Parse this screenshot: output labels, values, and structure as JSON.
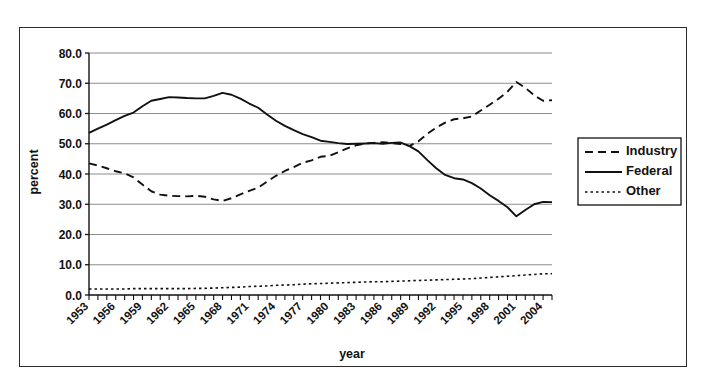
{
  "figure": {
    "background_color": "#ffffff",
    "frame_color": "#2b2b2b",
    "line_color": "#111111",
    "grid_color": "#8d8d8d"
  },
  "axis_titles": {
    "x": "year",
    "y": "percent"
  },
  "legend": {
    "position": "right",
    "entries": [
      {
        "label": "Industry",
        "style": "dashed"
      },
      {
        "label": "Federal",
        "style": "solid"
      },
      {
        "label": "Other",
        "style": "dotted"
      }
    ]
  },
  "y_ticks": [
    "0.0",
    "10.0",
    "20.0",
    "30.0",
    "40.0",
    "50.0",
    "60.0",
    "70.0",
    "80.0"
  ],
  "x_ticks": [
    "1953",
    "1956",
    "1959",
    "1962",
    "1965",
    "1968",
    "1971",
    "1974",
    "1977",
    "1980",
    "1983",
    "1986",
    "1989",
    "1992",
    "1995",
    "1998",
    "2001",
    "2004"
  ],
  "chart_data": {
    "type": "line",
    "title": "",
    "xlabel": "year",
    "ylabel": "percent",
    "xlim": [
      1953,
      2005
    ],
    "ylim": [
      0,
      80
    ],
    "grid": true,
    "legend_position": "right",
    "x": [
      1953,
      1954,
      1955,
      1956,
      1957,
      1958,
      1959,
      1960,
      1961,
      1962,
      1963,
      1964,
      1965,
      1966,
      1967,
      1968,
      1969,
      1970,
      1971,
      1972,
      1973,
      1974,
      1975,
      1976,
      1977,
      1978,
      1979,
      1980,
      1981,
      1982,
      1983,
      1984,
      1985,
      1986,
      1987,
      1988,
      1989,
      1990,
      1991,
      1992,
      1993,
      1994,
      1995,
      1996,
      1997,
      1998,
      1999,
      2000,
      2001,
      2002,
      2003,
      2004,
      2005
    ],
    "series": [
      {
        "name": "Industry",
        "style": "dashed",
        "values": [
          43.5,
          42.8,
          41.9,
          40.9,
          40.2,
          38.9,
          36.5,
          34.3,
          33.2,
          32.8,
          32.7,
          32.6,
          32.8,
          32.5,
          31.6,
          31.1,
          32.0,
          33.3,
          34.4,
          35.5,
          37.5,
          39.4,
          41.0,
          42.3,
          43.7,
          44.5,
          45.7,
          46.0,
          47.2,
          48.5,
          49.5,
          50.1,
          50.3,
          50.5,
          50.2,
          49.9,
          49.3,
          50.8,
          53.3,
          55.3,
          57.0,
          58.1,
          58.4,
          59.0,
          61.0,
          62.9,
          64.9,
          67.2,
          70.4,
          68.5,
          66.0,
          64.2,
          64.4
        ]
      },
      {
        "name": "Federal",
        "style": "solid",
        "values": [
          53.6,
          55.0,
          56.3,
          57.8,
          59.2,
          60.3,
          62.4,
          64.2,
          64.8,
          65.4,
          65.3,
          65.1,
          65.0,
          65.0,
          65.8,
          66.8,
          66.2,
          64.9,
          63.3,
          61.9,
          59.7,
          57.6,
          55.9,
          54.5,
          53.2,
          52.2,
          51.0,
          50.6,
          50.2,
          49.9,
          50.0,
          50.1,
          50.2,
          50.0,
          50.3,
          50.4,
          49.2,
          47.5,
          44.6,
          41.9,
          39.7,
          38.6,
          38.2,
          37.0,
          35.2,
          33.0,
          31.1,
          29.0,
          26.0,
          28.1,
          30.0,
          30.8,
          30.7
        ]
      },
      {
        "name": "Other",
        "style": "dotted",
        "values": [
          2.0,
          2.0,
          2.0,
          2.0,
          2.0,
          2.1,
          2.1,
          2.1,
          2.1,
          2.1,
          2.1,
          2.1,
          2.2,
          2.2,
          2.3,
          2.4,
          2.5,
          2.6,
          2.8,
          2.9,
          3.0,
          3.2,
          3.3,
          3.4,
          3.6,
          3.7,
          3.8,
          3.9,
          4.0,
          4.1,
          4.2,
          4.3,
          4.4,
          4.4,
          4.5,
          4.6,
          4.7,
          4.8,
          4.9,
          5.0,
          5.1,
          5.2,
          5.3,
          5.4,
          5.6,
          5.8,
          6.0,
          6.2,
          6.4,
          6.6,
          6.8,
          7.0,
          7.0
        ]
      }
    ]
  }
}
